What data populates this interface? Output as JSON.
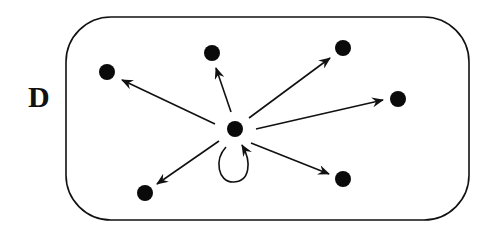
{
  "diagram": {
    "label": "D",
    "colors": {
      "stroke": "#111111",
      "node": "#0a0a0a",
      "background": "#ffffff"
    },
    "boundary": {
      "shape": "rounded-rectangle",
      "x": 66,
      "y": 17,
      "width": 403,
      "height": 203,
      "radius": 45
    },
    "center_node": {
      "id": "c",
      "x": 235,
      "y": 129,
      "self_loop": true
    },
    "nodes": [
      {
        "id": "n1",
        "x": 107,
        "y": 72
      },
      {
        "id": "n2",
        "x": 212,
        "y": 53
      },
      {
        "id": "n3",
        "x": 343,
        "y": 48
      },
      {
        "id": "n4",
        "x": 398,
        "y": 99
      },
      {
        "id": "n5",
        "x": 145,
        "y": 193
      },
      {
        "id": "n6",
        "x": 343,
        "y": 179
      }
    ],
    "edges": [
      {
        "from": "c",
        "to": "n1"
      },
      {
        "from": "c",
        "to": "n2"
      },
      {
        "from": "c",
        "to": "n3"
      },
      {
        "from": "c",
        "to": "n4"
      },
      {
        "from": "c",
        "to": "n5"
      },
      {
        "from": "c",
        "to": "n6"
      },
      {
        "from": "c",
        "to": "c",
        "type": "self-loop"
      }
    ]
  }
}
